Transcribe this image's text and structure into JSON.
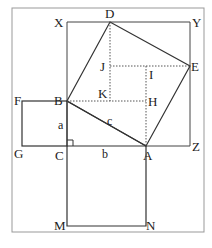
{
  "diagram": {
    "colors": {
      "line": "#333333",
      "frame": "#888888",
      "dotted": "#555555",
      "background": "#ffffff"
    },
    "points": {
      "X": [
        67,
        22
      ],
      "D": [
        110,
        22
      ],
      "Y": [
        190,
        22
      ],
      "J": [
        110,
        66
      ],
      "I": [
        146,
        66
      ],
      "E": [
        190,
        66
      ],
      "F": [
        22,
        101
      ],
      "B": [
        67,
        101
      ],
      "K": [
        110,
        101
      ],
      "H": [
        146,
        101
      ],
      "G": [
        22,
        146
      ],
      "C": [
        67,
        146
      ],
      "A": [
        146,
        146
      ],
      "Z": [
        190,
        146
      ],
      "M": [
        67,
        226
      ],
      "N": [
        146,
        226
      ]
    },
    "labels": {
      "X": "X",
      "D": "D",
      "Y": "Y",
      "J": "J",
      "I": "I",
      "E": "E",
      "F": "F",
      "B": "B",
      "K": "K",
      "H": "H",
      "G": "G",
      "C": "C",
      "A": "A",
      "Z": "Z",
      "M": "M",
      "N": "N",
      "side_a": "a",
      "side_b": "b",
      "side_c": "c"
    }
  }
}
